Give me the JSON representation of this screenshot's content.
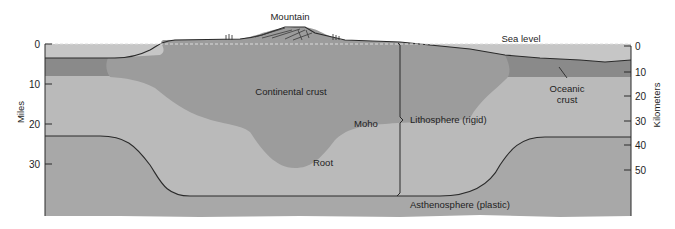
{
  "diagram": {
    "colors": {
      "background": "#ffffff",
      "sea_water": "#c6c6c6",
      "continental_crust": "#9c9c9c",
      "oceanic_crust": "#8a8a8a",
      "lithospheric_mantle": "#bababa",
      "asthenosphere": "#a8a8a8",
      "line": "#2a2a2a"
    },
    "labels": {
      "mountain": "Mountain",
      "sea_level": "Sea level",
      "continental_crust": "Continental crust",
      "oceanic_crust_line1": "Oceanic",
      "oceanic_crust_line2": "crust",
      "moho": "Moho",
      "root": "Root",
      "lithosphere": "Lithosphere (rigid)",
      "asthenosphere": "Asthenosphere (plastic)"
    },
    "left_axis": {
      "title": "Miles",
      "ticks": [
        "0",
        "10",
        "20",
        "30"
      ]
    },
    "right_axis": {
      "title": "Kilometers",
      "ticks": [
        "0",
        "10",
        "20",
        "30",
        "40",
        "50"
      ]
    }
  }
}
